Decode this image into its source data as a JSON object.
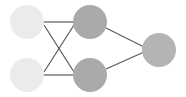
{
  "canvas": {
    "width": 186,
    "height": 97,
    "background": "#ffffff",
    "title": "neural-network-diagram"
  },
  "style": {
    "edge_color": "#595959",
    "edge_width": 1.2,
    "input_node_color": "#ebebeb",
    "hidden_node_color": "#aaaaaa",
    "output_node_color": "#b4b4b4",
    "node_radius": 17
  },
  "chart_data": {
    "type": "diagram",
    "title": "",
    "subtitle": "",
    "xlabel": "",
    "ylabel": "",
    "legend": [],
    "annotations": [],
    "layers": [
      {
        "name": "input-layer",
        "index": 0,
        "node_count": 2,
        "color": "#ebebeb"
      },
      {
        "name": "hidden-layer",
        "index": 1,
        "node_count": 2,
        "color": "#aaaaaa"
      },
      {
        "name": "output-layer",
        "index": 2,
        "node_count": 1,
        "color": "#b4b4b4"
      }
    ],
    "nodes": [
      {
        "id": "i1",
        "layer": 0,
        "label": "",
        "cx": 27,
        "cy": 22,
        "r": 17,
        "color": "#ebebeb"
      },
      {
        "id": "i2",
        "layer": 0,
        "label": "",
        "cx": 27,
        "cy": 75,
        "r": 17,
        "color": "#ebebeb"
      },
      {
        "id": "h1",
        "layer": 1,
        "label": "",
        "cx": 90,
        "cy": 22,
        "r": 17,
        "color": "#aaaaaa"
      },
      {
        "id": "h2",
        "layer": 1,
        "label": "",
        "cx": 90,
        "cy": 75,
        "r": 17,
        "color": "#aaaaaa"
      },
      {
        "id": "o1",
        "layer": 2,
        "label": "",
        "cx": 159,
        "cy": 50,
        "r": 17,
        "color": "#b4b4b4"
      }
    ],
    "edges": [
      {
        "id": "e1",
        "from": "i1",
        "to": "h1",
        "x1": 44,
        "y1": 22,
        "x2": 73,
        "y2": 22
      },
      {
        "id": "e2",
        "from": "i1",
        "to": "h2",
        "x1": 44,
        "y1": 25,
        "x2": 74,
        "y2": 72
      },
      {
        "id": "e3",
        "from": "i2",
        "to": "h1",
        "x1": 44,
        "y1": 72,
        "x2": 74,
        "y2": 25
      },
      {
        "id": "e4",
        "from": "i2",
        "to": "h2",
        "x1": 44,
        "y1": 75,
        "x2": 73,
        "y2": 75
      },
      {
        "id": "e5",
        "from": "h1",
        "to": "o1",
        "x1": 106,
        "y1": 28,
        "x2": 144,
        "y2": 47
      },
      {
        "id": "e6",
        "from": "h2",
        "to": "o1",
        "x1": 106,
        "y1": 69,
        "x2": 144,
        "y2": 52
      }
    ]
  }
}
